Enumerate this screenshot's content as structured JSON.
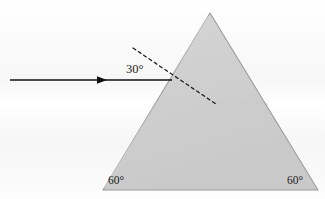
{
  "figure": {
    "background_color": "#fafafa",
    "prism": {
      "name": "equilateral-prism",
      "fill_color": "#cfcfcf",
      "stroke_color": "#9a9a9a",
      "apex": {
        "x": 210,
        "y": 13
      },
      "bottom_left": {
        "x": 103,
        "y": 190
      },
      "bottom_right": {
        "x": 318,
        "y": 190
      }
    },
    "incident_ray": {
      "name": "incident-ray",
      "color": "#101010",
      "start": {
        "x": 10,
        "y": 80
      },
      "end": {
        "x": 172,
        "y": 80
      },
      "arrowhead_at": {
        "x": 106,
        "y": 80
      }
    },
    "normal_line": {
      "name": "surface-normal-dashed",
      "color": "#1a1a1a",
      "style": "dashed",
      "start": {
        "x": 133,
        "y": 48
      },
      "end": {
        "x": 216,
        "y": 104
      }
    },
    "labels": {
      "incidence_angle": "30°",
      "base_angle_left": "60°",
      "base_angle_right": "60°"
    }
  }
}
